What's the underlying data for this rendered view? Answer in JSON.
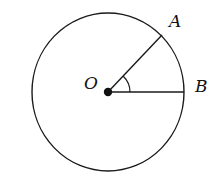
{
  "diagram": {
    "type": "circle-sector-angle",
    "stroke_color": "#1a1a1a",
    "background": "#ffffff",
    "center": {
      "label": "O",
      "x": 108,
      "y": 92
    },
    "circle": {
      "rx": 76,
      "ry": 79
    },
    "points": [
      {
        "label": "A",
        "x": 162,
        "y": 35
      },
      {
        "label": "B",
        "x": 184,
        "y": 92
      }
    ],
    "segments": [
      {
        "from": "O",
        "to": "A"
      },
      {
        "from": "O",
        "to": "B"
      }
    ],
    "angle_marker": {
      "vertex": "O",
      "between": [
        "A",
        "B"
      ]
    }
  }
}
